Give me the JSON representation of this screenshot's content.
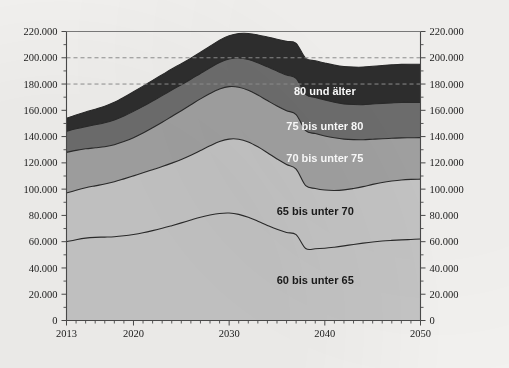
{
  "chart_data": {
    "type": "area",
    "stacked": true,
    "title": "",
    "subtitle": "",
    "xlabel": "",
    "ylabel": "",
    "xlim": [
      2013,
      2050
    ],
    "ylim": [
      0,
      220000
    ],
    "grid": "dashed horizontal gridlines at 180.000 and 200.000 only",
    "legend_position": "inline labels inside bands",
    "x_tick_labels": [
      "2013",
      "2020",
      "2030",
      "2040",
      "2050"
    ],
    "x_tick_values": [
      2013,
      2020,
      2030,
      2040,
      2050
    ],
    "x_minor_tick_step": 1,
    "y_tick_labels": [
      "0",
      "20.000",
      "40.000",
      "60.000",
      "80.000",
      "100.000",
      "120.000",
      "140.000",
      "160.000",
      "180.000",
      "200.000",
      "220.000"
    ],
    "y_tick_values": [
      0,
      20000,
      40000,
      60000,
      80000,
      100000,
      120000,
      140000,
      160000,
      180000,
      200000,
      220000
    ],
    "y_axis_both_sides": true,
    "gridline_values": [
      180000,
      200000
    ],
    "x": [
      2013,
      2014,
      2015,
      2016,
      2017,
      2018,
      2019,
      2020,
      2021,
      2022,
      2023,
      2024,
      2025,
      2026,
      2027,
      2028,
      2029,
      2030,
      2031,
      2032,
      2033,
      2034,
      2035,
      2036,
      2037,
      2038,
      2039,
      2040,
      2041,
      2042,
      2043,
      2044,
      2045,
      2046,
      2047,
      2048,
      2049,
      2050
    ],
    "series": [
      {
        "name": "60 bis unter 65",
        "color": "#c6c6c6",
        "label_color": "dark",
        "values": [
          60000,
          61500,
          62700,
          63300,
          63500,
          63800,
          64500,
          65500,
          66800,
          68400,
          70200,
          72200,
          74300,
          76500,
          78600,
          80300,
          81500,
          81800,
          80800,
          78600,
          75600,
          72400,
          69400,
          67000,
          65400,
          54800,
          54600,
          55000,
          55800,
          56800,
          57900,
          58900,
          59800,
          60500,
          61000,
          61400,
          61700,
          62000
        ]
      },
      {
        "name": "65 bis unter 70",
        "color": "#c6c6c6",
        "label_color": "dark",
        "values": [
          37000,
          37600,
          38300,
          39200,
          40400,
          41800,
          43300,
          44600,
          45600,
          46400,
          47000,
          47600,
          48300,
          49300,
          50800,
          52700,
          54700,
          56300,
          57200,
          57300,
          56600,
          55300,
          53600,
          51700,
          49800,
          47800,
          45900,
          44300,
          43200,
          42600,
          42600,
          43000,
          43800,
          44600,
          45200,
          45600,
          45700,
          45600
        ]
      },
      {
        "name": "70 bis unter 75",
        "color": "#a2a2a2",
        "label_color": "light",
        "values": [
          31000,
          30400,
          29700,
          29000,
          28400,
          28200,
          28400,
          29100,
          30300,
          31900,
          33700,
          35500,
          37100,
          38400,
          39300,
          39800,
          40000,
          39900,
          39600,
          39400,
          39400,
          39700,
          40300,
          41000,
          41600,
          41900,
          41800,
          41200,
          40100,
          38700,
          37200,
          35700,
          34400,
          33300,
          32500,
          32000,
          31700,
          31600
        ]
      },
      {
        "name": "75 bis unter 80",
        "color": "#6e6e6e",
        "label_color": "light",
        "values": [
          16000,
          16400,
          16900,
          17500,
          18200,
          18900,
          19500,
          20000,
          20300,
          20400,
          20300,
          20100,
          19800,
          19500,
          19400,
          19600,
          20200,
          21100,
          22200,
          23400,
          24600,
          25700,
          26600,
          27200,
          27500,
          27600,
          27500,
          27300,
          27000,
          26800,
          26700,
          26700,
          26800,
          26900,
          27000,
          27000,
          26900,
          26700
        ]
      },
      {
        "name": "80 und älter",
        "color": "#2e2e2e",
        "label_color": "light",
        "values": [
          10000,
          10500,
          11100,
          11800,
          12600,
          13400,
          14200,
          14900,
          15400,
          15700,
          15900,
          16000,
          16000,
          16000,
          16100,
          16400,
          16900,
          17600,
          18600,
          19800,
          21200,
          22700,
          24200,
          25600,
          26700,
          27500,
          28000,
          28200,
          28300,
          28400,
          28500,
          28600,
          28700,
          28800,
          28900,
          29000,
          29100,
          29100
        ]
      }
    ],
    "total_values": [
      154000,
      156400,
      158700,
      160800,
      163100,
      166100,
      169900,
      174100,
      178400,
      182800,
      187100,
      191400,
      195500,
      199700,
      204200,
      208800,
      213300,
      216700,
      218400,
      218500,
      217400,
      215800,
      214100,
      212500,
      211000,
      199600,
      197800,
      196000,
      194400,
      193300,
      192900,
      192900,
      193500,
      194100,
      194600,
      195000,
      195100,
      195000
    ]
  },
  "series_labels": [
    {
      "text": "80 und älter",
      "x": 2040,
      "y": 172000
    },
    {
      "text": "75 bis unter 80",
      "x": 2040,
      "y": 145000
    },
    {
      "text": "70 bis unter 75",
      "x": 2040,
      "y": 121000
    },
    {
      "text": "65 bis unter 70",
      "x": 2039,
      "y": 80000
    },
    {
      "text": "60 bis unter 65",
      "x": 2039,
      "y": 28000
    }
  ],
  "axes": {
    "left_tick_labels": [
      "220.000",
      "200.000",
      "180.000",
      "160.000",
      "140.000",
      "120.000",
      "100.000",
      "80.000",
      "60.000",
      "40.000",
      "20.000",
      "0"
    ],
    "right_tick_labels": [
      "220.000",
      "200.000",
      "180.000",
      "160.000",
      "140.000",
      "120.000",
      "100.000",
      "80.000",
      "60.000",
      "40.000",
      "20.000",
      "0"
    ],
    "bottom_tick_labels": [
      "2013",
      "2020",
      "2030",
      "2040",
      "2050"
    ]
  },
  "colors": {
    "band_60_65": "#c6c6c6",
    "band_65_70": "#c6c6c6",
    "band_70_75": "#a2a2a2",
    "band_75_80": "#6e6e6e",
    "band_80_plus": "#2e2e2e",
    "page_background": "#f3f2f0",
    "axis": "#4a4a4a",
    "gridline": "#8f8f8f"
  }
}
